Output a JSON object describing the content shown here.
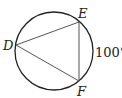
{
  "diagram": {
    "type": "inscribed-triangle-in-circle",
    "circle": {
      "cx": 54,
      "cy": 51,
      "r": 39
    },
    "points": {
      "D": {
        "label": "D",
        "x": 16,
        "y": 45
      },
      "E": {
        "label": "E",
        "x": 79,
        "y": 22
      },
      "F": {
        "label": "F",
        "x": 79,
        "y": 81
      }
    },
    "arc_label": "100°",
    "colors": {
      "stroke": "#222222",
      "chord": "#555555",
      "text": "#222222"
    }
  }
}
